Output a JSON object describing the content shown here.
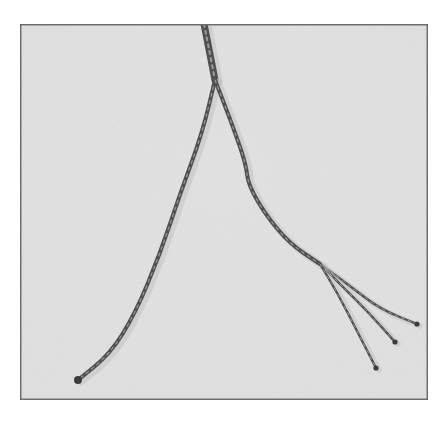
{
  "image": {
    "subject": "frayed twine strands splitting into separate threads",
    "frame": {
      "x": 20,
      "y": 24,
      "width": 408,
      "height": 376,
      "border_color": "#6e6e6e"
    },
    "background_color": "#e4e4e4",
    "strand_color": "#4f4f4f",
    "strands": [
      {
        "name": "main-twisted-strand",
        "points": [
          [
            184,
            0
          ],
          [
            188,
            20
          ],
          [
            195,
            56
          ]
        ]
      },
      {
        "name": "left-strand",
        "points": [
          [
            195,
            56
          ],
          [
            182,
            110
          ],
          [
            160,
            170
          ],
          [
            140,
            230
          ],
          [
            115,
            290
          ],
          [
            90,
            330
          ],
          [
            58,
            356
          ]
        ]
      },
      {
        "name": "right-strand-upper",
        "points": [
          [
            195,
            56
          ],
          [
            212,
            100
          ],
          [
            226,
            140
          ],
          [
            228,
            160
          ],
          [
            245,
            190
          ],
          [
            270,
            220
          ],
          [
            300,
            240
          ]
        ]
      },
      {
        "name": "right-strand-tip-1",
        "points": [
          [
            300,
            240
          ],
          [
            330,
            262
          ],
          [
            360,
            285
          ],
          [
            397,
            300
          ]
        ]
      },
      {
        "name": "right-strand-tip-2",
        "points": [
          [
            300,
            240
          ],
          [
            325,
            265
          ],
          [
            350,
            290
          ],
          [
            375,
            318
          ]
        ]
      },
      {
        "name": "right-strand-tip-3",
        "points": [
          [
            300,
            240
          ],
          [
            318,
            270
          ],
          [
            336,
            305
          ],
          [
            356,
            344
          ]
        ]
      }
    ]
  }
}
